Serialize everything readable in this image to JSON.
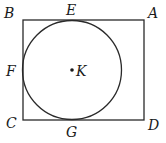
{
  "diagram": {
    "type": "geometry",
    "stroke_color": "#2a2a2a",
    "rectangle": {
      "vertices": {
        "A": {
          "label": "A",
          "x": 144,
          "y": 20
        },
        "B": {
          "label": "B",
          "x": 23,
          "y": 20
        },
        "C": {
          "label": "C",
          "x": 23,
          "y": 120
        },
        "D": {
          "label": "D",
          "x": 144,
          "y": 120
        }
      }
    },
    "circle": {
      "center": {
        "label": "K",
        "x": 72,
        "y": 70
      },
      "radius": 49
    },
    "tangent_points": {
      "E": {
        "label": "E",
        "x": 72,
        "y": 20
      },
      "F": {
        "label": "F",
        "x": 23,
        "y": 70
      },
      "G": {
        "label": "G",
        "x": 72,
        "y": 120
      }
    }
  }
}
